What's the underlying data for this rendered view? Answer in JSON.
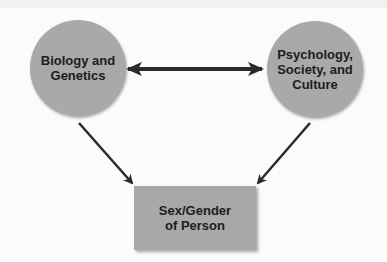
{
  "diagram": {
    "nodes": {
      "biology": {
        "label": "Biology and\nGenetics"
      },
      "psychology": {
        "label": "Psychology,\nSociety, and\nCulture"
      },
      "outcome": {
        "label": "Sex/Gender\nof Person"
      }
    },
    "edges": [
      {
        "from": "Biology and Genetics",
        "to": "Psychology, Society, and Culture",
        "type": "bidirectional"
      },
      {
        "from": "Biology and Genetics",
        "to": "Sex/Gender of Person",
        "type": "directed"
      },
      {
        "from": "Psychology, Society, and Culture",
        "to": "Sex/Gender of Person",
        "type": "directed"
      }
    ],
    "colors": {
      "node_fill": "#a9a9a9",
      "arrow": "#2a2a2a",
      "text": "#1c1c1c"
    }
  }
}
